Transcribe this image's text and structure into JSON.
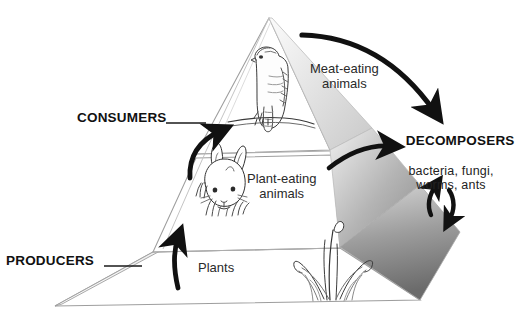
{
  "diagram": {
    "type": "ecological-pyramid",
    "background": "#ffffff",
    "ink": "#1a1a1a"
  },
  "side_labels": [
    {
      "id": "consumers",
      "text": "CONSUMERS",
      "style": "caps-bold",
      "leader": "line-to-pyramid-left-edge"
    },
    {
      "id": "producers",
      "text": "PRODUCERS",
      "style": "caps-bold",
      "leader": "line-to-pyramid-base-left"
    }
  ],
  "tiers": [
    {
      "id": "top",
      "label": "Meat-eating\nanimals",
      "organism": "hawk-illustration",
      "level": 3
    },
    {
      "id": "middle",
      "label": "Plant-eating\nanimals",
      "organism": "rabbit-illustration",
      "level": 2
    },
    {
      "id": "base",
      "label": "Plants",
      "organism": "grass-illustration",
      "level": 1
    }
  ],
  "decomposers": {
    "heading": "DECOMPOSERS",
    "detail": "bacteria, fungi,\nworms, ants"
  },
  "arrows": [
    {
      "id": "apex-to-decomposers",
      "from": "top-tier",
      "to": "decomposers",
      "shape": "long-arc"
    },
    {
      "id": "middle-to-decomposers",
      "from": "middle-tier",
      "to": "decomposers",
      "shape": "short-arc"
    },
    {
      "id": "decomposers-up",
      "from": "decomposers",
      "to": "base-tier",
      "shape": "curved-up"
    },
    {
      "id": "decomposers-down",
      "from": "decomposers",
      "to": "base-tier",
      "shape": "curved-down"
    },
    {
      "id": "base-to-middle",
      "from": "base-tier",
      "to": "middle-tier",
      "shape": "curved-up"
    },
    {
      "id": "middle-to-top",
      "from": "middle-tier",
      "to": "top-tier",
      "shape": "curved-up"
    }
  ],
  "colors": {
    "outline": "#9a9a9a",
    "arrow": "#111111",
    "side_face_light": "#f2f2f2",
    "side_face_mid": "#b9b9b9",
    "side_face_dark": "#6e6e6e",
    "text": "#1a1a1a"
  }
}
